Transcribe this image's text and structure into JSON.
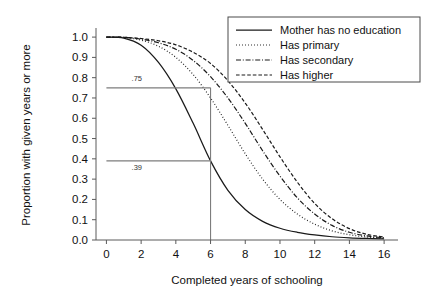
{
  "chart_data": {
    "type": "line",
    "title": "",
    "xlabel": "Completed years of schooling",
    "ylabel": "Proportion with given years or more",
    "xlim": [
      -0.6,
      16.8
    ],
    "ylim": [
      0.0,
      1.035
    ],
    "xticks": [
      0,
      2,
      4,
      6,
      8,
      10,
      12,
      14,
      16
    ],
    "xticklabels": [
      "0",
      "2",
      "4",
      "6",
      "8",
      "10",
      "12",
      "14",
      "16"
    ],
    "yticks": [
      0.0,
      0.1,
      0.2,
      0.3,
      0.4,
      0.5,
      0.6,
      0.7,
      0.8,
      0.9,
      1.0
    ],
    "yticklabels": [
      "0.0",
      "0.1",
      "0.2",
      "0.3",
      "0.4",
      "0.5",
      "0.6",
      "0.7",
      "0.8",
      "0.9",
      "1.0"
    ],
    "grid": false,
    "legend_position": "top-right",
    "x": [
      0,
      1,
      2,
      3,
      4,
      5,
      6,
      7,
      8,
      9,
      10,
      11,
      12,
      13,
      14,
      15,
      16
    ],
    "series": [
      {
        "name": "Mother has no education",
        "style": "solid",
        "values": [
          1.0,
          0.995,
          0.96,
          0.875,
          0.745,
          0.575,
          0.39,
          0.245,
          0.15,
          0.092,
          0.058,
          0.038,
          0.025,
          0.016,
          0.011,
          0.008,
          0.006
        ]
      },
      {
        "name": "Has primary",
        "style": "dotted",
        "values": [
          1.0,
          0.998,
          0.985,
          0.955,
          0.9,
          0.815,
          0.7,
          0.565,
          0.425,
          0.3,
          0.2,
          0.128,
          0.078,
          0.045,
          0.026,
          0.015,
          0.009
        ]
      },
      {
        "name": "Has secondary",
        "style": "dashdot",
        "values": [
          1.0,
          0.999,
          0.99,
          0.972,
          0.94,
          0.885,
          0.805,
          0.7,
          0.575,
          0.44,
          0.315,
          0.208,
          0.128,
          0.072,
          0.038,
          0.02,
          0.011
        ]
      },
      {
        "name": "Has higher",
        "style": "dashed",
        "values": [
          1.0,
          0.999,
          0.993,
          0.982,
          0.962,
          0.925,
          0.87,
          0.785,
          0.675,
          0.545,
          0.41,
          0.285,
          0.18,
          0.105,
          0.056,
          0.028,
          0.014
        ]
      }
    ],
    "annotations": [
      {
        "label": ".75",
        "type": "hline-value",
        "y": 0.75,
        "x_from": 0.0,
        "x_to": 6.0,
        "label_x": 1.45,
        "label_y": 0.785
      },
      {
        "label": ".39",
        "type": "hline-value",
        "y": 0.39,
        "x_from": 0.0,
        "x_to": 6.0,
        "label_x": 1.45,
        "label_y": 0.345
      },
      {
        "label": "",
        "type": "vline",
        "x": 6.0,
        "y_from": 0.0,
        "y_to": 0.75
      }
    ]
  },
  "legend": {
    "items": [
      {
        "label": "Mother has no education",
        "style": "solid"
      },
      {
        "label": "Has primary",
        "style": "dotted"
      },
      {
        "label": "Has secondary",
        "style": "dashdot"
      },
      {
        "label": "Has higher",
        "style": "dashed"
      }
    ]
  }
}
